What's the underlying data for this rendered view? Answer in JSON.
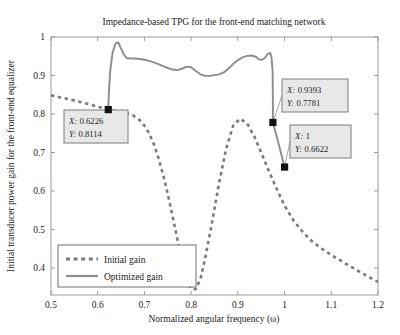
{
  "chart_data": {
    "type": "line",
    "title": "Impedance-based TPG for the front-end matching network",
    "xlabel": "Normalized angular frequency (ω)",
    "ylabel": "Initial transducer power gain for the front-end equalizer",
    "xlim": [
      0.5,
      1.2
    ],
    "ylim": [
      0.33,
      1.0
    ],
    "xticks": [
      0.5,
      0.6,
      0.7,
      0.8,
      0.9,
      1.0,
      1.1,
      1.2
    ],
    "xtick_labels": [
      "0.5",
      "0.6",
      "0.7",
      "0.8",
      "0.9",
      "1",
      "1.1",
      "1.2"
    ],
    "yticks": [
      0.4,
      0.5,
      0.6,
      0.7,
      0.8,
      0.9,
      1.0
    ],
    "ytick_labels": [
      "0.4",
      "0.5",
      "0.6",
      "0.7",
      "0.8",
      "0.9",
      "1"
    ],
    "grid": false,
    "legend_position": "lower-left",
    "series": [
      {
        "name": "Initial gain",
        "style": "dashed",
        "color": "#7a7a7a",
        "x": [
          0.5,
          0.52,
          0.54,
          0.56,
          0.58,
          0.6,
          0.6226,
          0.64,
          0.66,
          0.675,
          0.69,
          0.7,
          0.71,
          0.72,
          0.73,
          0.74,
          0.75,
          0.76,
          0.77,
          0.78,
          0.79,
          0.8,
          0.81,
          0.82,
          0.83,
          0.845,
          0.86,
          0.875,
          0.89,
          0.905,
          0.92,
          0.935,
          0.95,
          0.965,
          0.98,
          1.0,
          1.02,
          1.04,
          1.06,
          1.08,
          1.1,
          1.12,
          1.14,
          1.16,
          1.18,
          1.2
        ],
        "y": [
          0.849,
          0.843,
          0.838,
          0.832,
          0.826,
          0.819,
          0.8114,
          0.808,
          0.803,
          0.797,
          0.784,
          0.77,
          0.75,
          0.722,
          0.686,
          0.642,
          0.592,
          0.536,
          0.478,
          0.42,
          0.373,
          0.346,
          0.345,
          0.372,
          0.425,
          0.52,
          0.622,
          0.71,
          0.77,
          0.788,
          0.775,
          0.742,
          0.7,
          0.656,
          0.614,
          0.562,
          0.522,
          0.492,
          0.468,
          0.45,
          0.434,
          0.419,
          0.405,
          0.391,
          0.377,
          0.364
        ]
      },
      {
        "name": "Optimized gain",
        "style": "solid",
        "color": "#8d8d8d",
        "x": [
          0.6226,
          0.624,
          0.627,
          0.632,
          0.638,
          0.644,
          0.65,
          0.656,
          0.662,
          0.67,
          0.68,
          0.69,
          0.7,
          0.71,
          0.72,
          0.73,
          0.74,
          0.75,
          0.76,
          0.77,
          0.78,
          0.79,
          0.8,
          0.81,
          0.82,
          0.83,
          0.84,
          0.85,
          0.86,
          0.87,
          0.88,
          0.89,
          0.9,
          0.91,
          0.92,
          0.93,
          0.9393,
          0.945,
          0.952,
          0.958,
          0.964,
          0.969,
          0.972,
          0.9745,
          0.975,
          0.975
        ],
        "y": [
          0.8114,
          0.86,
          0.915,
          0.96,
          0.983,
          0.986,
          0.97,
          0.954,
          0.9455,
          0.944,
          0.944,
          0.943,
          0.941,
          0.938,
          0.934,
          0.9295,
          0.9245,
          0.9195,
          0.9155,
          0.914,
          0.9175,
          0.923,
          0.9215,
          0.912,
          0.903,
          0.899,
          0.899,
          0.901,
          0.903,
          0.908,
          0.918,
          0.93,
          0.94,
          0.947,
          0.951,
          0.952,
          0.948,
          0.942,
          0.941,
          0.946,
          0.9555,
          0.959,
          0.948,
          0.91,
          0.83,
          0.7781
        ]
      },
      {
        "name": "Optimized gain tail",
        "style": "solid",
        "color": "#8d8d8d",
        "x": [
          0.975,
          0.98,
          0.985,
          0.99,
          0.995,
          1.0
        ],
        "y": [
          0.7781,
          0.756,
          0.733,
          0.71,
          0.686,
          0.6622
        ]
      }
    ],
    "datatips": [
      {
        "name": "datatip-initial-gain",
        "x_label": "X: 0.6226",
        "y_label": "Y: 0.8114",
        "x": 0.6226,
        "y": 0.8114,
        "box_px": {
          "x": 64,
          "y": 110,
          "w": 64,
          "h": 33
        }
      },
      {
        "name": "datatip-optimized-knee",
        "x_label": "X: 0.9393",
        "y_label": "Y: 0.7781",
        "x": 0.975,
        "y": 0.7781,
        "box_px": {
          "x": 282,
          "y": 79,
          "w": 66,
          "h": 33
        }
      },
      {
        "name": "datatip-optimized-end",
        "x_label": "X: 1",
        "y_label": "Y: 0.6622",
        "x": 1.0,
        "y": 0.6622,
        "box_px": {
          "x": 290,
          "y": 125,
          "w": 61,
          "h": 33
        }
      }
    ],
    "legend": {
      "entries": [
        {
          "label": "Initial gain",
          "style": "dashed",
          "color": "#7a7a7a"
        },
        {
          "label": "Optimized gain",
          "style": "solid",
          "color": "#8d8d8d"
        }
      ],
      "box_px": {
        "x": 58,
        "y": 245,
        "w": 138,
        "h": 42
      }
    },
    "colors": {
      "initial_gain": "#7a7a7a",
      "optimized_gain": "#8d8d8d",
      "axis": "#9a9a9a",
      "text": "#1a1a1a",
      "datatip_fill": "#e8e8e8",
      "datatip_border": "#7d7d7d"
    }
  }
}
